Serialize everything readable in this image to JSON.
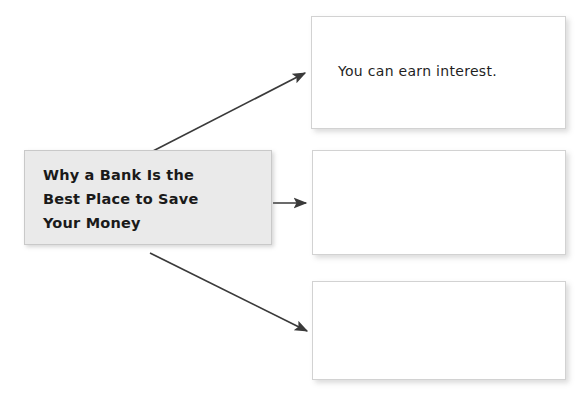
{
  "diagram": {
    "type": "graphic-organizer",
    "title_box": {
      "text": "Why a Bank Is the\nBest Place to Save\nYour Money",
      "fill_color": "#eaeaea",
      "border_color": "#c9c9c9"
    },
    "detail_boxes": [
      {
        "text": "You can earn interest.",
        "fill_color": "#ffffff",
        "border_color": "#d2d2d2"
      },
      {
        "text": "",
        "fill_color": "#ffffff",
        "border_color": "#d2d2d2"
      },
      {
        "text": "",
        "fill_color": "#ffffff",
        "border_color": "#d2d2d2"
      }
    ],
    "arrows": [
      {
        "name": "arrow-to-detail-1",
        "direction": "up-right",
        "color": "#3a3a3a"
      },
      {
        "name": "arrow-to-detail-2",
        "direction": "right",
        "color": "#3a3a3a"
      },
      {
        "name": "arrow-to-detail-3",
        "direction": "down-right",
        "color": "#3a3a3a"
      }
    ]
  }
}
